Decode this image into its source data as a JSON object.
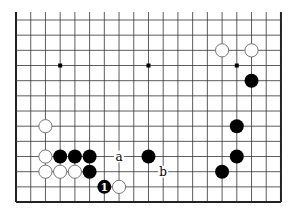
{
  "diagram": {
    "columns": 19,
    "rows_shown": 13,
    "open_edge": "top",
    "geometry": {
      "x0": 16,
      "dx": 14.72,
      "y0": 20,
      "dy": 15.17
    },
    "colors": {
      "line": "#333333",
      "border": "#222222",
      "black_stone": "#000000",
      "white_stone": "#ffffff",
      "white_outline": "#555555"
    },
    "star_points": [
      {
        "col": 3,
        "row": 3
      },
      {
        "col": 9,
        "row": 3
      },
      {
        "col": 15,
        "row": 3
      }
    ],
    "stones": [
      {
        "color": "white",
        "col": 14,
        "row": 2
      },
      {
        "color": "white",
        "col": 16,
        "row": 2
      },
      {
        "color": "black",
        "col": 16,
        "row": 4
      },
      {
        "color": "white",
        "col": 2,
        "row": 7
      },
      {
        "color": "black",
        "col": 15,
        "row": 7
      },
      {
        "color": "white",
        "col": 2,
        "row": 9
      },
      {
        "color": "black",
        "col": 3,
        "row": 9
      },
      {
        "color": "black",
        "col": 4,
        "row": 9
      },
      {
        "color": "black",
        "col": 5,
        "row": 9
      },
      {
        "color": "black",
        "col": 9,
        "row": 9
      },
      {
        "color": "black",
        "col": 15,
        "row": 9
      },
      {
        "color": "white",
        "col": 2,
        "row": 10
      },
      {
        "color": "white",
        "col": 3,
        "row": 10
      },
      {
        "color": "white",
        "col": 4,
        "row": 10
      },
      {
        "color": "black",
        "col": 5,
        "row": 10
      },
      {
        "color": "black",
        "col": 14,
        "row": 10
      },
      {
        "color": "black",
        "col": 6,
        "row": 11,
        "label": "1"
      },
      {
        "color": "white",
        "col": 7,
        "row": 11
      }
    ],
    "labels": [
      {
        "text": "a",
        "col": 7,
        "row": 9
      },
      {
        "text": "b",
        "col": 10,
        "row": 10
      }
    ]
  }
}
